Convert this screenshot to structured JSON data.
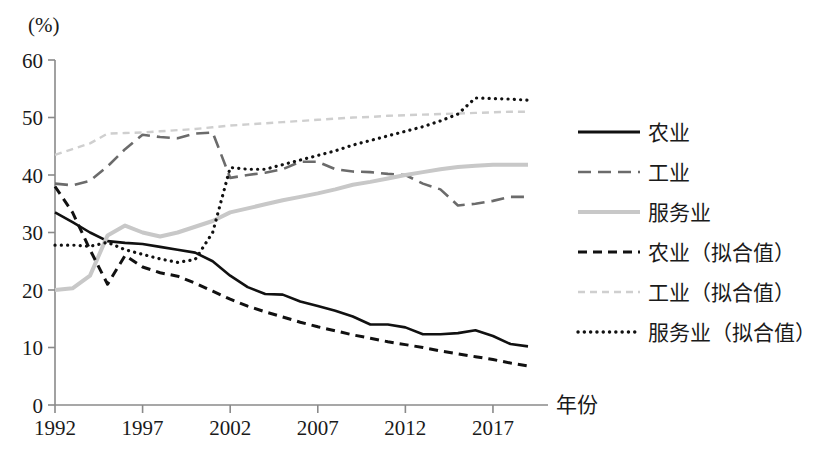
{
  "chart_data": {
    "type": "line",
    "title": "",
    "xlabel": "年份",
    "ylabel": "(%)",
    "xlim": [
      1992,
      2019
    ],
    "ylim": [
      0,
      60
    ],
    "grid": false,
    "legend_position": "right",
    "xticks": [
      "1992",
      "1997",
      "2002",
      "2007",
      "2012",
      "2017"
    ],
    "xtick_values": [
      1992,
      1997,
      2002,
      2007,
      2012,
      2017
    ],
    "yticks": [
      "0",
      "10",
      "20",
      "30",
      "40",
      "50",
      "60"
    ],
    "ytick_values": [
      0,
      10,
      20,
      30,
      40,
      50,
      60
    ],
    "x": [
      1992,
      1993,
      1994,
      1995,
      1996,
      1997,
      1998,
      1999,
      2000,
      2001,
      2002,
      2003,
      2004,
      2005,
      2006,
      2007,
      2008,
      2009,
      2010,
      2011,
      2012,
      2013,
      2014,
      2015,
      2016,
      2017,
      2018,
      2019
    ],
    "series": [
      {
        "name": "农业",
        "style": "solid",
        "color": "#111111",
        "width": 2.6,
        "values": [
          33.5,
          31.8,
          30.0,
          28.5,
          28.2,
          28.0,
          27.5,
          27.0,
          26.5,
          25.0,
          22.5,
          20.5,
          19.3,
          19.2,
          18.0,
          17.2,
          16.4,
          15.4,
          14.0,
          14.0,
          13.5,
          12.3,
          12.3,
          12.5,
          13.0,
          12.0,
          10.6,
          10.2
        ]
      },
      {
        "name": "工业",
        "style": "dashed",
        "color": "#6b6b6b",
        "width": 2.6,
        "values": [
          38.5,
          38.2,
          39.0,
          41.5,
          44.5,
          47.0,
          46.6,
          46.4,
          47.2,
          47.4,
          39.5,
          40.0,
          40.4,
          41.0,
          42.3,
          42.3,
          41.0,
          40.6,
          40.5,
          40.2,
          40.0,
          38.5,
          37.5,
          34.7,
          35.0,
          35.5,
          36.2,
          36.2
        ]
      },
      {
        "name": "服务业",
        "style": "solid-light",
        "color": "#c8c8c8",
        "width": 4.0,
        "values": [
          20.0,
          20.3,
          22.5,
          29.5,
          31.2,
          30.0,
          29.3,
          30.0,
          31.0,
          32.0,
          33.5,
          34.2,
          34.9,
          35.6,
          36.2,
          36.8,
          37.5,
          38.3,
          38.8,
          39.4,
          40.0,
          40.5,
          41.0,
          41.4,
          41.6,
          41.8,
          41.8,
          41.8
        ]
      },
      {
        "name": "农业（拟合值）",
        "style": "dashed-bold",
        "color": "#111111",
        "width": 3.0,
        "values": [
          38.0,
          33.5,
          27.0,
          21.0,
          26.0,
          24.0,
          23.0,
          22.4,
          21.2,
          19.8,
          18.4,
          17.2,
          16.2,
          15.3,
          14.4,
          13.6,
          12.9,
          12.2,
          11.6,
          11.0,
          10.5,
          10.0,
          9.4,
          8.9,
          8.4,
          7.9,
          7.3,
          6.8
        ]
      },
      {
        "name": "工业（拟合值）",
        "style": "dashed-light",
        "color": "#cfcfcf",
        "width": 2.4,
        "values": [
          43.5,
          44.5,
          45.5,
          47.2,
          47.3,
          47.4,
          47.6,
          47.8,
          48.0,
          48.3,
          48.6,
          48.8,
          49.0,
          49.2,
          49.4,
          49.6,
          49.8,
          50.0,
          50.1,
          50.3,
          50.4,
          50.5,
          50.6,
          50.7,
          50.8,
          50.9,
          51.0,
          51.0
        ]
      },
      {
        "name": "服务业（拟合值）",
        "style": "dotted",
        "color": "#111111",
        "width": 3.2,
        "values": [
          27.8,
          27.8,
          27.6,
          28.3,
          27.0,
          26.2,
          25.4,
          24.8,
          25.3,
          30.0,
          41.3,
          41.0,
          41.0,
          41.8,
          42.6,
          43.4,
          44.2,
          45.2,
          46.0,
          46.8,
          47.6,
          48.4,
          49.4,
          50.6,
          53.4,
          53.3,
          53.2,
          53.0
        ]
      }
    ]
  },
  "legend": {
    "items": [
      {
        "label": "农业",
        "style": "solid",
        "color": "#111111"
      },
      {
        "label": "工业",
        "style": "dashed",
        "color": "#6b6b6b"
      },
      {
        "label": "服务业",
        "style": "solid-light",
        "color": "#c8c8c8"
      },
      {
        "label": "农业（拟合值）",
        "style": "dashed-bold",
        "color": "#111111"
      },
      {
        "label": "工业（拟合值）",
        "style": "dashed-light",
        "color": "#cfcfcf"
      },
      {
        "label": "服务业（拟合值）",
        "style": "dotted",
        "color": "#111111"
      }
    ]
  },
  "axis": {
    "unit_label": "(%)",
    "x_title": "年份",
    "line_color": "#8a8a8a"
  }
}
